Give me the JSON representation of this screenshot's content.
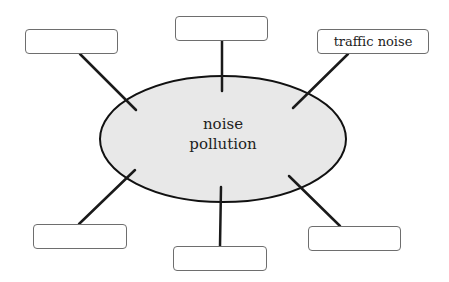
{
  "diagram": {
    "type": "concept-map",
    "center": {
      "line1": "noise",
      "line2": "pollution",
      "fill": "#e8e8e8",
      "stroke": "#111111"
    },
    "boxes": [
      {
        "position": "top-left",
        "label": ""
      },
      {
        "position": "top",
        "label": ""
      },
      {
        "position": "top-right",
        "label": "traffic noise"
      },
      {
        "position": "bottom-left",
        "label": ""
      },
      {
        "position": "bottom",
        "label": ""
      },
      {
        "position": "bottom-right",
        "label": ""
      }
    ]
  }
}
